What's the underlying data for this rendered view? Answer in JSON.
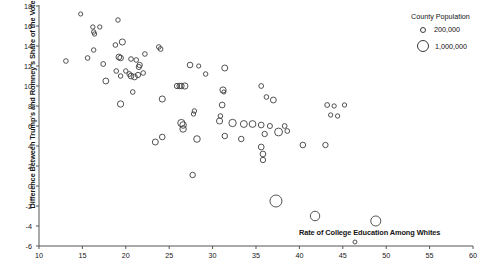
{
  "chart_data": {
    "type": "scatter",
    "title": "",
    "subtitle": "",
    "xlabel": "Rate of College Education Among Whites",
    "ylabel": "Difference Between Trump's and Romney's Share of the Vote",
    "xlim": [
      10,
      60
    ],
    "ylim": [
      -6,
      18
    ],
    "xticks": [
      10,
      15,
      20,
      25,
      30,
      35,
      40,
      45,
      50,
      55,
      60
    ],
    "yticks": [
      18,
      16,
      14,
      12,
      10,
      8,
      6,
      4,
      2,
      0,
      -2,
      -4,
      -6
    ],
    "grid": false,
    "legend": {
      "position": "top-right",
      "title": "County Population",
      "entries": [
        {
          "label": "200,000",
          "value": 200000,
          "marker": "open-circle",
          "radius_px": 3.0
        },
        {
          "label": "1,000,000",
          "value": 1000000,
          "marker": "open-circle",
          "radius_px": 6.0
        }
      ]
    },
    "size_encoding": {
      "variable": "County Population",
      "marker": "open-circle",
      "note": "Marker area scales with county population"
    },
    "points": [
      {
        "x": 14.8,
        "y": 17.2,
        "pop": 120000
      },
      {
        "x": 13.1,
        "y": 12.5,
        "pop": 150000
      },
      {
        "x": 16.2,
        "y": 15.9,
        "pop": 130000
      },
      {
        "x": 17.0,
        "y": 15.9,
        "pop": 130000
      },
      {
        "x": 16.3,
        "y": 15.4,
        "pop": 140000
      },
      {
        "x": 16.4,
        "y": 15.2,
        "pop": 130000
      },
      {
        "x": 19.1,
        "y": 16.6,
        "pop": 140000
      },
      {
        "x": 19.6,
        "y": 14.4,
        "pop": 260000
      },
      {
        "x": 18.8,
        "y": 14.1,
        "pop": 150000
      },
      {
        "x": 23.8,
        "y": 13.9,
        "pop": 150000
      },
      {
        "x": 24.0,
        "y": 13.7,
        "pop": 160000
      },
      {
        "x": 22.2,
        "y": 13.2,
        "pop": 150000
      },
      {
        "x": 16.3,
        "y": 13.6,
        "pop": 140000
      },
      {
        "x": 15.6,
        "y": 12.8,
        "pop": 150000
      },
      {
        "x": 19.2,
        "y": 12.9,
        "pop": 230000
      },
      {
        "x": 19.4,
        "y": 12.8,
        "pop": 220000
      },
      {
        "x": 20.6,
        "y": 12.7,
        "pop": 150000
      },
      {
        "x": 21.2,
        "y": 12.6,
        "pop": 150000
      },
      {
        "x": 17.4,
        "y": 12.2,
        "pop": 160000
      },
      {
        "x": 21.6,
        "y": 12.1,
        "pop": 200000
      },
      {
        "x": 21.5,
        "y": 11.9,
        "pop": 190000
      },
      {
        "x": 27.4,
        "y": 12.1,
        "pop": 220000
      },
      {
        "x": 28.4,
        "y": 12.0,
        "pop": 120000
      },
      {
        "x": 31.4,
        "y": 11.8,
        "pop": 250000
      },
      {
        "x": 18.9,
        "y": 11.5,
        "pop": 150000
      },
      {
        "x": 20.0,
        "y": 11.5,
        "pop": 140000
      },
      {
        "x": 22.0,
        "y": 11.3,
        "pop": 150000
      },
      {
        "x": 19.4,
        "y": 11.0,
        "pop": 140000
      },
      {
        "x": 20.4,
        "y": 11.2,
        "pop": 160000
      },
      {
        "x": 20.6,
        "y": 11.0,
        "pop": 230000
      },
      {
        "x": 21.4,
        "y": 11.1,
        "pop": 200000
      },
      {
        "x": 21.0,
        "y": 10.9,
        "pop": 230000
      },
      {
        "x": 29.2,
        "y": 11.2,
        "pop": 140000
      },
      {
        "x": 17.7,
        "y": 10.5,
        "pop": 240000
      },
      {
        "x": 25.9,
        "y": 10.0,
        "pop": 200000
      },
      {
        "x": 26.4,
        "y": 10.0,
        "pop": 220000
      },
      {
        "x": 26.8,
        "y": 10.0,
        "pop": 270000
      },
      {
        "x": 26.2,
        "y": 10.0,
        "pop": 200000
      },
      {
        "x": 35.6,
        "y": 10.0,
        "pop": 160000
      },
      {
        "x": 20.8,
        "y": 9.4,
        "pop": 150000
      },
      {
        "x": 31.2,
        "y": 9.6,
        "pop": 270000
      },
      {
        "x": 31.3,
        "y": 9.4,
        "pop": 120000
      },
      {
        "x": 36.2,
        "y": 8.9,
        "pop": 150000
      },
      {
        "x": 37.0,
        "y": 8.6,
        "pop": 240000
      },
      {
        "x": 24.2,
        "y": 8.7,
        "pop": 260000
      },
      {
        "x": 19.4,
        "y": 8.2,
        "pop": 280000
      },
      {
        "x": 31.1,
        "y": 8.1,
        "pop": 230000
      },
      {
        "x": 45.2,
        "y": 8.1,
        "pop": 130000
      },
      {
        "x": 43.2,
        "y": 8.1,
        "pop": 160000
      },
      {
        "x": 44.0,
        "y": 8.0,
        "pop": 130000
      },
      {
        "x": 27.9,
        "y": 7.5,
        "pop": 140000
      },
      {
        "x": 27.8,
        "y": 7.2,
        "pop": 130000
      },
      {
        "x": 30.9,
        "y": 7.0,
        "pop": 150000
      },
      {
        "x": 43.6,
        "y": 7.1,
        "pop": 130000
      },
      {
        "x": 44.4,
        "y": 7.0,
        "pop": 130000
      },
      {
        "x": 26.4,
        "y": 6.3,
        "pop": 360000
      },
      {
        "x": 26.6,
        "y": 6.1,
        "pop": 300000
      },
      {
        "x": 26.6,
        "y": 5.7,
        "pop": 290000
      },
      {
        "x": 30.8,
        "y": 6.5,
        "pop": 260000
      },
      {
        "x": 32.3,
        "y": 6.3,
        "pop": 380000
      },
      {
        "x": 33.6,
        "y": 6.2,
        "pop": 330000
      },
      {
        "x": 34.6,
        "y": 6.2,
        "pop": 320000
      },
      {
        "x": 35.6,
        "y": 6.1,
        "pop": 230000
      },
      {
        "x": 36.6,
        "y": 6.0,
        "pop": 180000
      },
      {
        "x": 38.3,
        "y": 6.0,
        "pop": 160000
      },
      {
        "x": 37.6,
        "y": 5.4,
        "pop": 430000
      },
      {
        "x": 38.6,
        "y": 5.5,
        "pop": 160000
      },
      {
        "x": 36.0,
        "y": 5.2,
        "pop": 200000
      },
      {
        "x": 31.4,
        "y": 5.0,
        "pop": 210000
      },
      {
        "x": 24.2,
        "y": 4.9,
        "pop": 220000
      },
      {
        "x": 28.2,
        "y": 4.7,
        "pop": 300000
      },
      {
        "x": 33.3,
        "y": 4.7,
        "pop": 210000
      },
      {
        "x": 23.4,
        "y": 4.4,
        "pop": 250000
      },
      {
        "x": 35.6,
        "y": 3.9,
        "pop": 230000
      },
      {
        "x": 40.4,
        "y": 4.1,
        "pop": 220000
      },
      {
        "x": 43.0,
        "y": 4.1,
        "pop": 200000
      },
      {
        "x": 35.8,
        "y": 3.2,
        "pop": 230000
      },
      {
        "x": 35.8,
        "y": 2.6,
        "pop": 200000
      },
      {
        "x": 27.7,
        "y": 1.1,
        "pop": 210000
      },
      {
        "x": 37.3,
        "y": -1.5,
        "pop": 1000000
      },
      {
        "x": 41.8,
        "y": -3.0,
        "pop": 620000
      },
      {
        "x": 48.8,
        "y": -3.5,
        "pop": 700000
      },
      {
        "x": 46.4,
        "y": -5.6,
        "pop": 110000
      }
    ]
  },
  "axes": {
    "x": {
      "label": "Rate of College Education Among Whites",
      "tick_labels": [
        "10",
        "15",
        "20",
        "25",
        "30",
        "35",
        "40",
        "45",
        "50",
        "55",
        "60"
      ]
    },
    "y": {
      "label": "Difference Between Trump's and Romney's Share of the Vote",
      "tick_labels": [
        "18",
        "16",
        "14",
        "12",
        "10",
        "8",
        "6",
        "4",
        "2",
        "0",
        "-2",
        "-4",
        "-6"
      ]
    }
  },
  "legend": {
    "title": "County Population",
    "items": [
      {
        "label": "200,000"
      },
      {
        "label": "1,000,000"
      }
    ]
  },
  "colors": {
    "marker_stroke": "#404040",
    "axis": "#555555",
    "text": "#141414",
    "background": "#ffffff"
  }
}
